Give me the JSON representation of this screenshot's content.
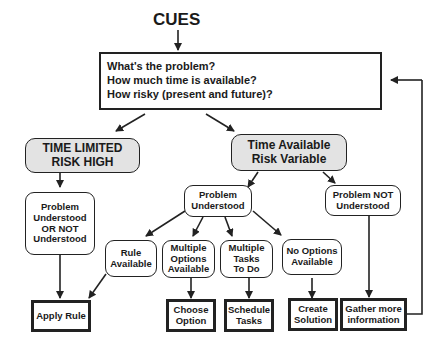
{
  "title": "CUES",
  "assessment_box": {
    "lines": [
      "What's the problem?",
      "How much time is available?",
      "How risky (present and future)?"
    ]
  },
  "branches": {
    "time_limited": "TIME LIMITED\nRISK HIGH",
    "time_available": "Time  Available\nRisk Variable"
  },
  "conditions": {
    "either_understood": "Problem\nUnderstood\nOR NOT\nUnderstood",
    "problem_understood": "Problem\nUnderstood",
    "problem_not_understood": "Problem NOT\nUnderstood",
    "rule_available": "Rule\nAvailable",
    "multiple_options": "Multiple\nOptions\nAvailable",
    "multiple_tasks": "Multiple\nTasks\nTo Do",
    "no_options": "No Options\nAvailable"
  },
  "actions": {
    "apply_rule": "Apply Rule",
    "choose_option": "Choose\nOption",
    "schedule_tasks": "Schedule\nTasks",
    "create_solution": "Create\nSolution",
    "gather_information": "Gather more\ninformation"
  },
  "colors": {
    "line": "#222222",
    "branch_fill": "#e3e3e3",
    "background": "#ffffff"
  }
}
